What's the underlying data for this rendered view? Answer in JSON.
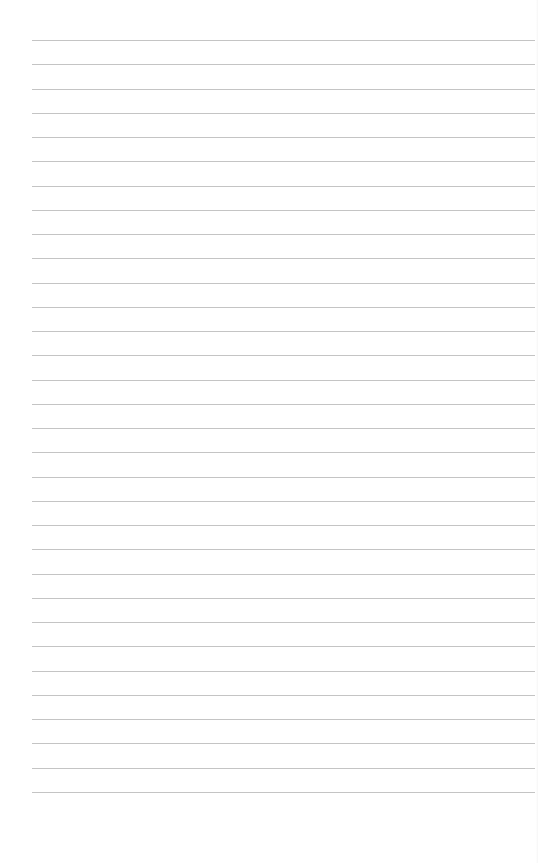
{
  "page": {
    "type": "lined-paper",
    "background_color": "#ffffff",
    "line_color": "#c4c4c4",
    "line_count": 32,
    "first_line_y": 40,
    "line_spacing": 24.25,
    "line_left_x": 32,
    "line_right_x": 535,
    "text": []
  }
}
